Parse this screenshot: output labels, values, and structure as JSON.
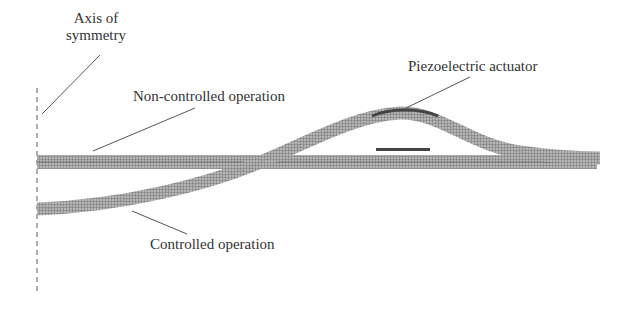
{
  "diagram": {
    "labels": {
      "axis": [
        "Axis of",
        "symmetry"
      ],
      "non_controlled": "Non-controlled operation",
      "controlled": "Controlled operation",
      "actuator": "Piezoelectric actuator"
    },
    "colors": {
      "beam": "#8a8a8a",
      "mesh": "#5a5a5a",
      "actuator": "#444444",
      "leader": "#555555",
      "axis": "#777777"
    }
  }
}
